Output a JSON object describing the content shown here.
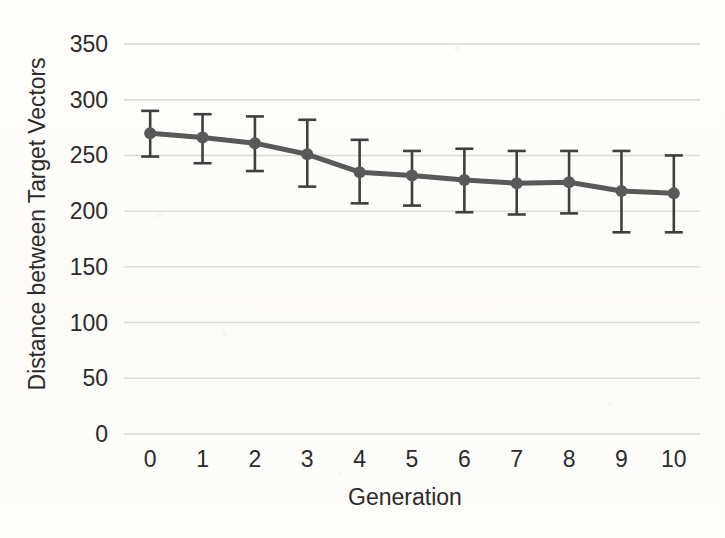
{
  "chart_data": {
    "type": "line",
    "title": "",
    "xlabel": "Generation",
    "ylabel": "Distance between Target Vectors",
    "x": [
      0,
      1,
      2,
      3,
      4,
      5,
      6,
      7,
      8,
      9,
      10
    ],
    "xtick_labels": [
      "0",
      "1",
      "2",
      "3",
      "4",
      "5",
      "6",
      "7",
      "8",
      "9",
      "10"
    ],
    "ytick_labels": [
      "0",
      "50",
      "100",
      "150",
      "200",
      "250",
      "300",
      "350"
    ],
    "yticks": [
      0,
      50,
      100,
      150,
      200,
      250,
      300,
      350
    ],
    "ylim": [
      0,
      350
    ],
    "xlim": [
      -0.5,
      10.5
    ],
    "grid": "horizontal",
    "legend": "none",
    "series": [
      {
        "name": "Distance between Target Vectors",
        "values": [
          270,
          266,
          261,
          251,
          235,
          232,
          228,
          225,
          226,
          218,
          216
        ],
        "error_upper": [
          290,
          287,
          285,
          282,
          264,
          254,
          256,
          254,
          254,
          254,
          250
        ],
        "error_lower": [
          249,
          243,
          236,
          222,
          207,
          205,
          199,
          197,
          198,
          181,
          181
        ],
        "color": "#595959",
        "marker": "circle",
        "line_width": 5,
        "marker_size": 12
      }
    ]
  },
  "style": {
    "background_color": "#fdfdfb",
    "gridline_color": "#d9d9d6",
    "text_color": "#2b2b2b",
    "series_color": "#595959",
    "errorbar_color": "#3f3f3f"
  }
}
